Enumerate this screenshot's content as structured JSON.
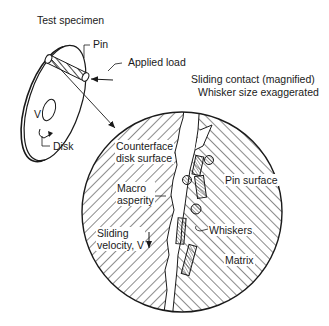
{
  "figure": {
    "title": "Test specimen",
    "subtitle_line1": "Sliding contact (magnified)",
    "subtitle_line2": "Whisker size exaggerated"
  },
  "labels": {
    "pin": "Pin",
    "applied_load": "Applied load",
    "disk": "Disk",
    "velocity_symbol": "V",
    "counterface": "Counterface\ndisk surface",
    "macro_asperity": "Macro\nasperity",
    "sliding_velocity": "Sliding\nvelocity, V",
    "pin_surface": "Pin surface",
    "whiskers": "Whiskers",
    "matrix": "Matrix"
  },
  "colors": {
    "line": "#1a1a1a",
    "background": "#ffffff"
  }
}
